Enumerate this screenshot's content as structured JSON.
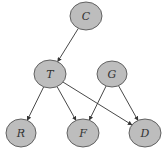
{
  "diagram": {
    "type": "bayesian-network",
    "colors": {
      "node_fill": "#bdbdbd",
      "node_stroke": "#555555",
      "edge": "#333333",
      "label": "#333333",
      "background": "#ffffff"
    },
    "nodes": [
      {
        "id": "C",
        "label": "C",
        "cx": 86,
        "cy": 16,
        "rx": 16,
        "ry": 14
      },
      {
        "id": "T",
        "label": "T",
        "cx": 50,
        "cy": 74,
        "rx": 16,
        "ry": 14
      },
      {
        "id": "G",
        "label": "G",
        "cx": 112,
        "cy": 74,
        "rx": 15,
        "ry": 13
      },
      {
        "id": "R",
        "label": "R",
        "cx": 21,
        "cy": 133,
        "rx": 15,
        "ry": 14
      },
      {
        "id": "F",
        "label": "F",
        "cx": 83,
        "cy": 133,
        "rx": 16,
        "ry": 14
      },
      {
        "id": "D",
        "label": "D",
        "cx": 145,
        "cy": 133,
        "rx": 16,
        "ry": 14
      }
    ],
    "edges": [
      {
        "from": "C",
        "to": "T"
      },
      {
        "from": "T",
        "to": "R"
      },
      {
        "from": "T",
        "to": "F"
      },
      {
        "from": "T",
        "to": "D"
      },
      {
        "from": "G",
        "to": "F"
      },
      {
        "from": "G",
        "to": "D"
      }
    ]
  }
}
